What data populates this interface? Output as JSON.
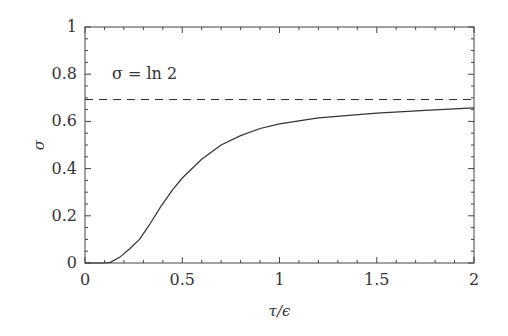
{
  "chart_data": {
    "type": "line",
    "title": "",
    "xlabel": "τ/ϵ",
    "ylabel": "σ",
    "xlim": [
      0,
      2
    ],
    "ylim": [
      0,
      1
    ],
    "grid": false,
    "xticks": [
      "0",
      "0.5",
      "1",
      "1.5",
      "2"
    ],
    "yticks": [
      "0",
      "0.2",
      "0.4",
      "0.6",
      "0.8",
      "1"
    ],
    "annotation": "σ = ln 2",
    "series": [
      {
        "name": "σ(τ/ϵ)",
        "style": "solid",
        "x": [
          0,
          0.1,
          0.13,
          0.18,
          0.23,
          0.28,
          0.33,
          0.39,
          0.45,
          0.5,
          0.6,
          0.7,
          0.8,
          0.9,
          1.0,
          1.2,
          1.5,
          1.75,
          2.0
        ],
        "y": [
          0,
          0,
          0.003,
          0.025,
          0.06,
          0.1,
          0.16,
          0.24,
          0.31,
          0.36,
          0.44,
          0.5,
          0.54,
          0.57,
          0.59,
          0.615,
          0.635,
          0.647,
          0.657
        ]
      },
      {
        "name": "σ = ln 2",
        "style": "dashed",
        "x": [
          0,
          2
        ],
        "y": [
          0.693,
          0.693
        ]
      }
    ]
  }
}
